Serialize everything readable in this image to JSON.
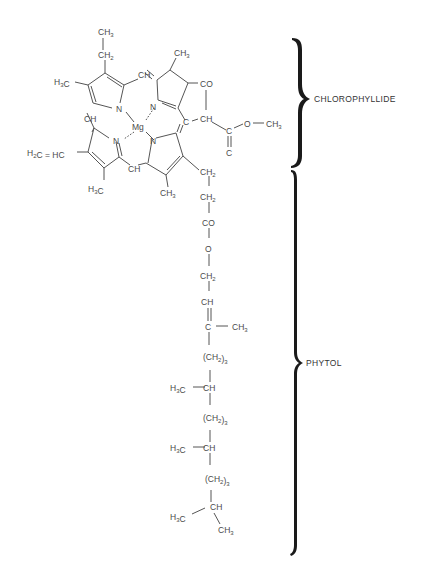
{
  "regions": {
    "chlorophyllide": {
      "label": "CHLOROPHYLLIDE"
    },
    "phytol": {
      "label": "PHYTOL"
    }
  },
  "atoms": {
    "central_metal": "Mg",
    "ring_nitrogen": "N",
    "ring_a_ethyl_ch3": "CH3",
    "ring_a_ethyl_ch2": "CH2",
    "ring_a_methyl": "H3C",
    "ring_b_methyl": "CH3",
    "meso_ch_top": "CH",
    "meso_ch_left": "CH",
    "meso_ch_bottom": "CH",
    "meso_c_right": "C",
    "ring_e_co": "CO",
    "ring_e_ch": "CH",
    "ester_c": "C",
    "ester_o": "O",
    "ester_ch3": "CH3",
    "ester_carbonyl_o": "C",
    "vinyl": "H2C = HC",
    "ring_c_methyl": "H3C",
    "ring_d_methyl": "CH3",
    "propionate_ch2_1": "CH2",
    "propionate_ch2_2": "CH2",
    "propionate_co": "CO",
    "propionate_o": "O"
  },
  "phytol_chain": [
    "CH2",
    "CH",
    "C",
    "(CH2)3",
    "CH",
    "(CH2)3",
    "CH",
    "(CH2)3",
    "CH"
  ],
  "phytol_branches": {
    "methyl_1": "CH3",
    "methyl_2": "H3C",
    "methyl_3": "H3C",
    "terminal_left": "H3C",
    "terminal_right": "CH3"
  }
}
